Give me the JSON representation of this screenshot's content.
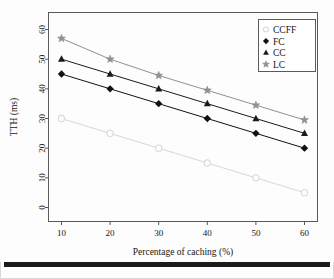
{
  "chart_data": {
    "type": "line",
    "title": "",
    "subtitle": "",
    "xlabel": "Percentage of caching (%)",
    "ylabel": "TTH (ms)",
    "x": [
      10,
      20,
      30,
      40,
      50,
      60
    ],
    "xtick_labels": [
      "10",
      "20",
      "30",
      "40",
      "50",
      "60"
    ],
    "ytick_labels": [
      "0",
      "10",
      "20",
      "30",
      "40",
      "50",
      "60"
    ],
    "yticks": [
      0,
      10,
      20,
      30,
      40,
      50,
      60
    ],
    "xlim": [
      10,
      60
    ],
    "ylim": [
      0,
      60
    ],
    "grid": false,
    "legend_position": "top-right",
    "series": [
      {
        "name": "CCFF",
        "marker": "open-circle",
        "color": "#d8d8d8",
        "values": [
          30,
          25,
          20,
          15,
          10,
          5
        ]
      },
      {
        "name": "FC",
        "marker": "filled-diamond",
        "color": "#111111",
        "values": [
          45,
          40,
          35,
          30,
          25,
          20
        ]
      },
      {
        "name": "CC",
        "marker": "filled-triangle",
        "color": "#1a1a1a",
        "values": [
          50,
          45,
          40,
          35,
          30,
          25
        ]
      },
      {
        "name": "LC",
        "marker": "star",
        "color": "#909090",
        "values": [
          57,
          50,
          44.5,
          39.5,
          34.5,
          29.5
        ]
      }
    ]
  },
  "legend": {
    "entries": [
      "CCFF",
      "FC",
      "CC",
      "LC"
    ]
  },
  "colors": {
    "frame": "#555555",
    "page_border": "#d9d9d9",
    "bottom_bar": "#1b1b1b",
    "text": "#161616"
  }
}
